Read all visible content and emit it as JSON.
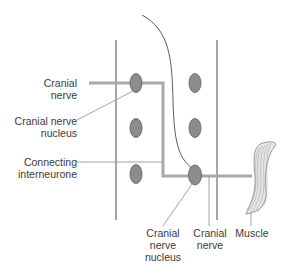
{
  "diagram": {
    "labels": {
      "cranial_nerve_left": [
        "Cranial",
        "nerve"
      ],
      "cranial_nerve_nucleus_left": [
        "Cranial nerve",
        "nucleus"
      ],
      "connecting_interneurone": [
        "Connecting",
        "interneurone"
      ],
      "cranial_nerve_nucleus_bottom": [
        "Cranial",
        "nerve",
        "nucleus"
      ],
      "cranial_nerve_bottom": [
        "Cranial",
        "nerve"
      ],
      "muscle": "Muscle"
    },
    "colors": {
      "nerve_path": "#a8a8a8",
      "nucleus_fill": "#8c8c8c",
      "nucleus_stroke": "#5a5a5a",
      "outline": "#4a4a4a",
      "leader": "#8a8a8a"
    }
  }
}
